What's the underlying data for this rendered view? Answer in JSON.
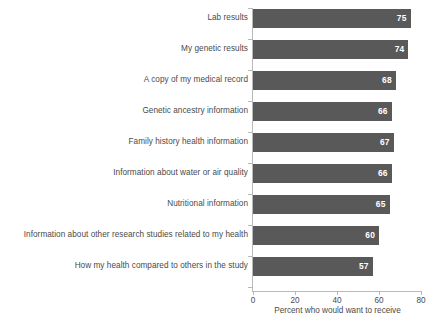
{
  "chart_data": {
    "type": "bar",
    "orientation": "horizontal",
    "title": "",
    "xlabel": "Percent who would want to receive",
    "ylabel": "",
    "xlim": [
      0,
      80
    ],
    "xticks": [
      0,
      20,
      40,
      60,
      80
    ],
    "grid": false,
    "legend": null,
    "bar_color": "#595959",
    "value_label_color": "#ffffff",
    "categories": [
      "Lab results",
      "My genetic results",
      "A copy of my medical record",
      "Genetic ancestry information",
      "Family history health information",
      "Information about water or air quality",
      "Nutritional information",
      "Information about other research studies related to my health",
      "How my health compared to others in the study"
    ],
    "values": [
      75,
      74,
      68,
      66,
      67,
      66,
      65,
      60,
      57
    ],
    "value_labels": [
      "75",
      "74",
      "68",
      "66",
      "67",
      "66",
      "65",
      "60",
      "57"
    ]
  }
}
